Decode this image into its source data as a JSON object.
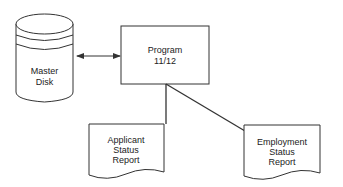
{
  "diagram": {
    "type": "system-flowchart",
    "nodes": [
      {
        "id": "master_disk",
        "shape": "magnetic-disk",
        "label_lines": [
          "Master",
          "Disk"
        ]
      },
      {
        "id": "program",
        "shape": "process-box",
        "label_lines": [
          "Program",
          "11/12"
        ]
      },
      {
        "id": "applicant_report",
        "shape": "document",
        "label_lines": [
          "Applicant",
          "Status",
          "Report"
        ]
      },
      {
        "id": "employment_report",
        "shape": "document",
        "label_lines": [
          "Employment",
          "Status",
          "Report"
        ]
      }
    ],
    "edges": [
      {
        "from": "master_disk",
        "to": "program",
        "style": "bidirectional-arrow"
      },
      {
        "from": "program",
        "to": "applicant_report",
        "style": "line"
      },
      {
        "from": "program",
        "to": "employment_report",
        "style": "line"
      }
    ],
    "colors": {
      "line": "#333333",
      "text": "#222222",
      "background": "#ffffff"
    }
  }
}
